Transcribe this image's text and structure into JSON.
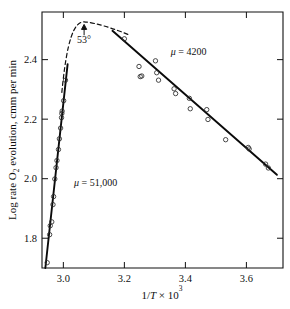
{
  "chart_data": {
    "type": "scatter",
    "title": "",
    "xlabel": "1/T × 10³",
    "ylabel": "Log rate O₂ evolution, cmm per min",
    "xlim": [
      2.93,
      3.72
    ],
    "ylim": [
      1.7,
      2.56
    ],
    "grid": false,
    "legend": "none",
    "xticks": [
      3.0,
      3.2,
      3.4,
      3.6
    ],
    "xtick_labels": [
      "3.0",
      "3.2",
      "3.4",
      "3.6"
    ],
    "yticks": [
      1.8,
      2.0,
      2.2,
      2.4
    ],
    "ytick_labels": [
      "1.8",
      "2.0",
      "2.2",
      "2.4"
    ],
    "ylabel_parts": {
      "pre": "Log rate O",
      "sub": "2",
      "post": " evolution, cmm per min"
    },
    "xlabel_parts": {
      "pre": "1/",
      "italic": "T",
      "mid": " × 10",
      "sup": "3"
    },
    "series": [
      {
        "name": "low-temperature branch",
        "marker": "open-circle",
        "points": [
          [
            2.947,
            1.718
          ],
          [
            2.955,
            1.812
          ],
          [
            2.957,
            1.842
          ],
          [
            2.962,
            1.855
          ],
          [
            2.966,
            1.913
          ],
          [
            2.968,
            1.94
          ],
          [
            2.972,
            1.999
          ],
          [
            2.976,
            2.037
          ],
          [
            2.979,
            2.061
          ],
          [
            2.984,
            2.098
          ],
          [
            2.987,
            2.134
          ],
          [
            2.991,
            2.17
          ],
          [
            2.994,
            2.205
          ],
          [
            2.995,
            2.219
          ],
          [
            2.996,
            2.227
          ],
          [
            3.001,
            2.262
          ],
          [
            3.007,
            2.331
          ]
        ]
      },
      {
        "name": "high-temperature branch",
        "marker": "open-circle",
        "points": [
          [
            3.2,
            2.47
          ],
          [
            3.248,
            2.377
          ],
          [
            3.252,
            2.343
          ],
          [
            3.257,
            2.345
          ],
          [
            3.302,
            2.396
          ],
          [
            3.306,
            2.356
          ],
          [
            3.312,
            2.331
          ],
          [
            3.363,
            2.302
          ],
          [
            3.368,
            2.286
          ],
          [
            3.413,
            2.27
          ],
          [
            3.416,
            2.235
          ],
          [
            3.47,
            2.232
          ],
          [
            3.474,
            2.199
          ],
          [
            3.532,
            2.131
          ],
          [
            3.606,
            2.105
          ],
          [
            3.609,
            2.1
          ],
          [
            3.663,
            2.049
          ],
          [
            3.672,
            2.036
          ]
        ]
      }
    ],
    "fit_lines": [
      {
        "name": "steep-fit-line",
        "label": "μ = 51,000",
        "slope_annotation": "μ = 51,000",
        "x_from": 2.941,
        "y_from": 1.7,
        "x_to": 3.014,
        "y_to": 2.385
      },
      {
        "name": "shallow-fit-line",
        "label": "μ = 4200",
        "slope_annotation": "μ = 4200",
        "x_from": 3.161,
        "y_from": 2.497,
        "x_to": 3.7,
        "y_to": 2.013
      }
    ],
    "dashed_curve": {
      "name": "transition-curve",
      "description": "dashed curve joining the two branches through the maximum",
      "peak_x": 3.068,
      "peak_y": 2.527
    },
    "annotations": [
      {
        "name": "peak-temperature-annotation",
        "text": "53°",
        "x": 3.068,
        "y": 2.455,
        "arrow_to_x": 3.068,
        "arrow_to_y": 2.52
      },
      {
        "name": "mu-high-annotation",
        "text": "μ = 4200",
        "x": 3.352,
        "y": 2.417
      },
      {
        "name": "mu-low-annotation",
        "text": "μ = 51,000",
        "x": 3.035,
        "y": 1.975
      }
    ],
    "colors": {
      "axis": "#111111",
      "line": "#0a0a0a",
      "marker": "#2b2b2b",
      "background": "#ffffff"
    }
  }
}
